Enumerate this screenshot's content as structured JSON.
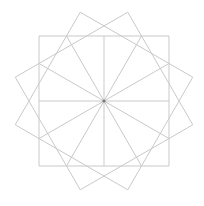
{
  "diagram": {
    "type": "geometric-star",
    "center": [
      104,
      101
    ],
    "square_side": 130,
    "rotations_deg": [
      0,
      30,
      -30
    ],
    "spoke_count": 12,
    "spoke_step_deg": 30,
    "colors": {
      "background": "#ffffff",
      "stroke": "#c9c9c9",
      "center_dot": "#7a7a7a"
    }
  }
}
